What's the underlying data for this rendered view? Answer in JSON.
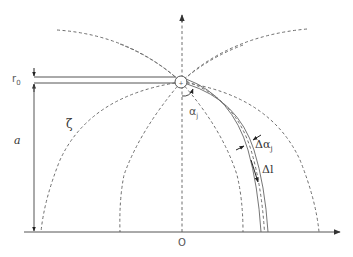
{
  "diagram": {
    "type": "electrode field-line schematic",
    "labels": {
      "r0": "r",
      "r0_sub": "0",
      "a": "a",
      "zeta": "ζ",
      "alpha_j": "α",
      "alpha_j_sub": "j",
      "delta_alpha_j": "Δα",
      "delta_alpha_j_sub": "j",
      "delta_l": "Δl",
      "origin": "O"
    },
    "colors": {
      "line": "#555555",
      "dashed": "#6e6e6e",
      "text": "#333333",
      "background": "#ffffff"
    },
    "elements": [
      "vertical dashed axis with up arrow",
      "horizontal baseline with right arrow",
      "rod of radius r0 at height a",
      "source point circle at rod tip",
      "dashed field lines radiating from source",
      "curved double-line flux tube with dash centerline",
      "angle marker alpha_j",
      "width marker delta alpha_j",
      "length marker delta l"
    ]
  }
}
